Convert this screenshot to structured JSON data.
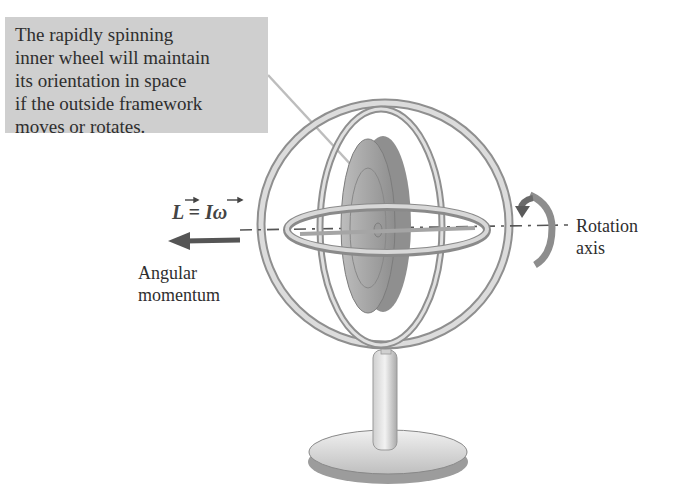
{
  "callout": {
    "lines": [
      "The rapidly spinning",
      "inner wheel will maintain",
      "its orientation in space",
      "if the outside framework",
      "moves or rotates."
    ],
    "background": "#cfcfcf"
  },
  "labels": {
    "equation_L": "L",
    "equation_rest": " = I",
    "equation_omega": "ω",
    "angular_line1": "Angular",
    "angular_line2": "momentum",
    "rotation_line1": "Rotation",
    "rotation_line2": "axis"
  },
  "colors": {
    "frame": "#9a9a9a",
    "frame_light": "#d6d6d6",
    "wheel": "#a8a8a8",
    "arrow": "#555555"
  }
}
